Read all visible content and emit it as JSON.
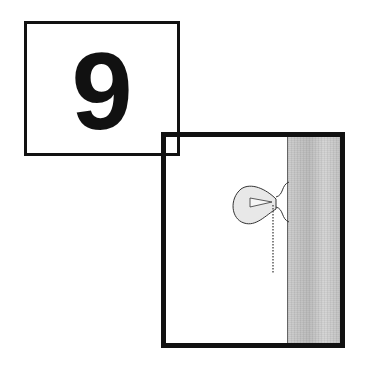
{
  "number_card": {
    "value": "9"
  },
  "scene": {
    "description": "Light bulb with pull chain mounted on a wall",
    "elements": [
      "light-bulb",
      "pull-chain",
      "wall"
    ]
  },
  "colors": {
    "ink": "#111111",
    "wall": "#c8c8c8",
    "bulb_fill": "#e6e6e6",
    "background": "#ffffff"
  }
}
